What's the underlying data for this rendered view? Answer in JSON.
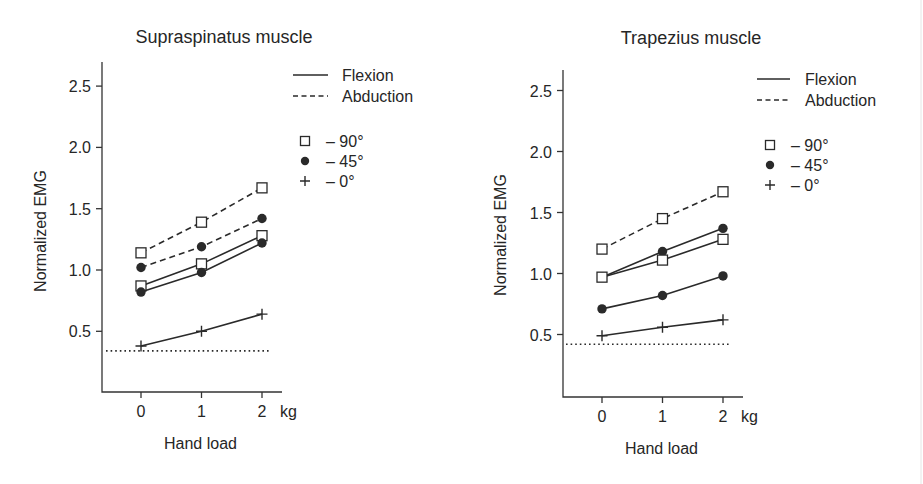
{
  "chart_data": [
    {
      "type": "line",
      "title": "Supraspinatus muscle",
      "xlabel": "Hand load",
      "x_unit": "kg",
      "ylabel": "Normalized EMG",
      "categories": [
        "0",
        "1",
        "2"
      ],
      "x": [
        0,
        1,
        2
      ],
      "yticks": [
        "0.5",
        "1.0",
        "1.5",
        "2.0",
        "2.5"
      ],
      "ytick_values": [
        0.5,
        1.0,
        1.5,
        2.0,
        2.5
      ],
      "ylim": [
        0,
        2.65
      ],
      "grid": false,
      "legend_position": "upper right",
      "legend": {
        "line_styles": [
          {
            "label": "Flexion",
            "style": "solid"
          },
          {
            "label": "Abduction",
            "style": "dashed"
          }
        ],
        "markers": [
          {
            "label": "– 90°",
            "marker": "open-square"
          },
          {
            "label": "– 45°",
            "marker": "filled-circle"
          },
          {
            "label": "– 0°",
            "marker": "plus"
          }
        ]
      },
      "series": [
        {
          "name": "Abduction 90°",
          "style": "dashed",
          "marker": "open-square",
          "values": [
            1.14,
            1.39,
            1.67
          ]
        },
        {
          "name": "Abduction 45°",
          "style": "dashed",
          "marker": "filled-circle",
          "values": [
            1.02,
            1.19,
            1.42
          ]
        },
        {
          "name": "Flexion 90°",
          "style": "solid",
          "marker": "open-square",
          "values": [
            0.87,
            1.05,
            1.28
          ]
        },
        {
          "name": "Flexion 45°",
          "style": "solid",
          "marker": "filled-circle",
          "values": [
            0.82,
            0.98,
            1.22
          ]
        },
        {
          "name": "Flexion 0°",
          "style": "solid",
          "marker": "plus",
          "values": [
            0.38,
            0.5,
            0.64
          ]
        }
      ],
      "reference_line": {
        "style": "dotted",
        "value": 0.34
      }
    },
    {
      "type": "line",
      "title": "Trapezius muscle",
      "xlabel": "Hand load",
      "x_unit": "kg",
      "ylabel": "Normalized EMG",
      "categories": [
        "0",
        "1",
        "2"
      ],
      "x": [
        0,
        1,
        2
      ],
      "yticks": [
        "0.5",
        "1.0",
        "1.5",
        "2.0",
        "2.5"
      ],
      "ytick_values": [
        0.5,
        1.0,
        1.5,
        2.0,
        2.5
      ],
      "ylim": [
        0,
        2.65
      ],
      "grid": false,
      "legend_position": "upper right",
      "legend": {
        "line_styles": [
          {
            "label": "Flexion",
            "style": "solid"
          },
          {
            "label": "Abduction",
            "style": "dashed"
          }
        ],
        "markers": [
          {
            "label": "– 90°",
            "marker": "open-square"
          },
          {
            "label": "– 45°",
            "marker": "filled-circle"
          },
          {
            "label": "– 0°",
            "marker": "plus"
          }
        ]
      },
      "series": [
        {
          "name": "Abduction 90°",
          "style": "dashed",
          "marker": "open-square",
          "values": [
            1.2,
            1.45,
            1.67
          ]
        },
        {
          "name": "45° (upper)",
          "style": "solid",
          "marker": "filled-circle",
          "values": [
            0.97,
            1.18,
            1.37
          ]
        },
        {
          "name": "Flexion 90°",
          "style": "solid",
          "marker": "open-square",
          "values": [
            0.97,
            1.11,
            1.28
          ]
        },
        {
          "name": "Flexion 45°",
          "style": "solid",
          "marker": "filled-circle",
          "values": [
            0.71,
            0.82,
            0.98
          ]
        },
        {
          "name": "Flexion 0°",
          "style": "solid",
          "marker": "plus",
          "values": [
            0.49,
            0.56,
            0.62
          ]
        }
      ],
      "reference_line": {
        "style": "dotted",
        "value": 0.42
      }
    }
  ],
  "colors": {
    "ink": "#2a2a2a",
    "background": "#ffffff"
  }
}
